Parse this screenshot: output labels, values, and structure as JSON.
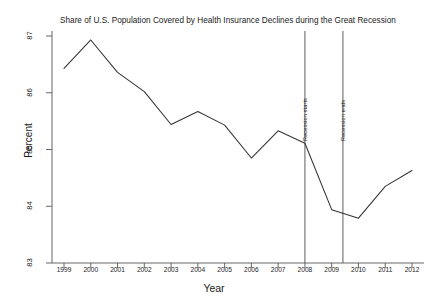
{
  "chart_data": {
    "type": "line",
    "title": "Share of U.S. Population Covered by Health Insurance Declines during the Great Recession",
    "xlabel": "Year",
    "ylabel": "Percent",
    "xlim": [
      1999,
      2012
    ],
    "ylim": [
      83,
      87
    ],
    "grid": false,
    "legend": null,
    "x": [
      1999,
      2000,
      2001,
      2002,
      2003,
      2004,
      2005,
      2006,
      2007,
      2008,
      2009,
      2010,
      2011,
      2012
    ],
    "values": [
      86.43,
      86.93,
      86.36,
      86.02,
      85.44,
      85.67,
      85.43,
      84.85,
      85.33,
      85.11,
      83.94,
      83.79,
      84.35,
      84.63
    ],
    "x_tick_labels": [
      "1999",
      "2000",
      "2001",
      "2002",
      "2003",
      "2004",
      "2005",
      "2006",
      "2007",
      "2008",
      "2009",
      "2010",
      "2011",
      "2012"
    ],
    "y_tick_labels": [
      "83",
      "84",
      "85",
      "86",
      "87"
    ],
    "y_ticks": [
      83,
      84,
      85,
      86,
      87
    ],
    "annotations": [
      {
        "label": "Recession starts",
        "x": 2008.0
      },
      {
        "label": "Recession ends",
        "x": 2009.42
      }
    ],
    "line_color": "#333333"
  }
}
